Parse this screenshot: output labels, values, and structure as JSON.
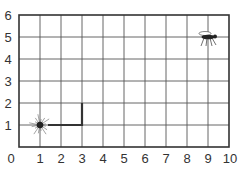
{
  "chart_data": {
    "type": "grid",
    "title": "",
    "xlabel": "",
    "ylabel": "",
    "xlim": [
      0,
      10
    ],
    "ylim": [
      0,
      6
    ],
    "x_ticks": [
      "0",
      "1",
      "2",
      "3",
      "4",
      "5",
      "6",
      "7",
      "8",
      "9",
      "10"
    ],
    "y_ticks": [
      "1",
      "2",
      "3",
      "4",
      "5",
      "6"
    ],
    "grid": true,
    "objects": [
      {
        "name": "spider",
        "x": 1,
        "y": 1
      },
      {
        "name": "fly",
        "x": 9,
        "y": 5
      }
    ],
    "path": [
      [
        1,
        1
      ],
      [
        3,
        1
      ],
      [
        3,
        2
      ]
    ]
  },
  "labels": {
    "origin": "0",
    "x": [
      "1",
      "2",
      "3",
      "4",
      "5",
      "6",
      "7",
      "8",
      "9",
      "10"
    ],
    "y": [
      "1",
      "2",
      "3",
      "4",
      "5",
      "6"
    ]
  }
}
